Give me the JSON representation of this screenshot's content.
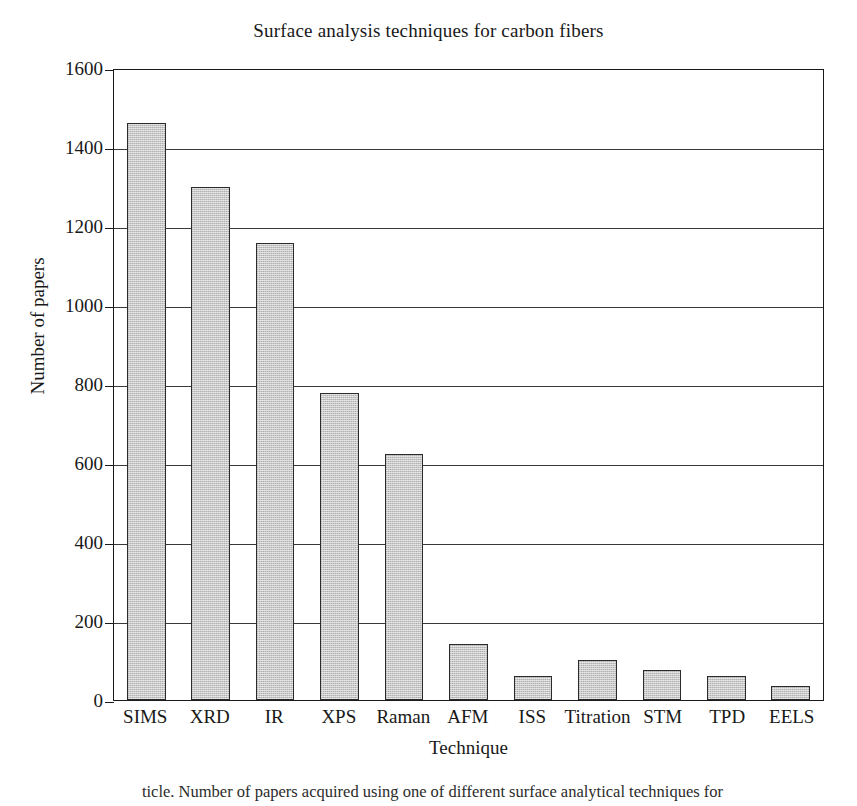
{
  "chart_data": {
    "type": "bar",
    "title": "Surface analysis techniques for carbon fibers",
    "xlabel": "Technique",
    "ylabel": "Number of papers",
    "categories": [
      "SIMS",
      "XRD",
      "IR",
      "XPS",
      "Raman",
      "AFM",
      "ISS",
      "Titration",
      "STM",
      "TPD",
      "EELS"
    ],
    "values": [
      1462,
      1298,
      1158,
      778,
      622,
      143,
      60,
      101,
      77,
      60,
      36
    ],
    "ylim": [
      0,
      1600
    ],
    "ytick_labels": [
      "1600",
      "1400",
      "1200",
      "1000",
      "800",
      "600",
      "400",
      "200",
      "0"
    ],
    "ytick_values": [
      1600,
      1400,
      1200,
      1000,
      800,
      600,
      400,
      200,
      0
    ],
    "grid": "horizontal",
    "legend": "none",
    "bar_fill_color": "#c9c9c9",
    "bar_edge_color": "#2b2b2b",
    "axis_color": "#1a1a1a"
  },
  "caption": {
    "fragment": "ticle. Number of papers acquired using one of different surface analytical techniques for"
  }
}
